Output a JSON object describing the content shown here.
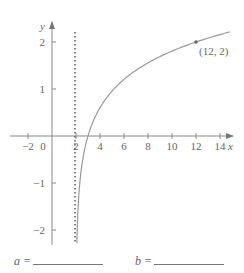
{
  "chart_data": {
    "type": "line",
    "title": "",
    "xlabel": "x",
    "ylabel": "y",
    "xlim": [
      -3,
      15
    ],
    "ylim": [
      -2.3,
      2.3
    ],
    "x_ticks": [
      -2,
      0,
      2,
      4,
      6,
      8,
      10,
      12,
      14
    ],
    "x_tick_labels": [
      "−2",
      "0",
      "2",
      "4",
      "6",
      "8",
      "10",
      "12",
      "14"
    ],
    "y_ticks": [
      -2,
      -1,
      1,
      2
    ],
    "y_tick_labels": [
      "−2",
      "−1",
      "1",
      "2"
    ],
    "grid": false,
    "series": [
      {
        "name": "y = log_b(x − a)",
        "function": "log",
        "base": 3.1623,
        "shift": 2,
        "x_range": [
          2.02,
          14.8
        ]
      }
    ],
    "asymptote": {
      "x": 2,
      "style": "dotted"
    },
    "points": [
      {
        "x": 12,
        "y": 2,
        "label": "(12, 2)"
      }
    ]
  },
  "answers": {
    "a_label": "a =",
    "b_label": "b ="
  },
  "colors": {
    "axis": "#777777",
    "curve": "#888888",
    "asymptote": "#666666"
  }
}
